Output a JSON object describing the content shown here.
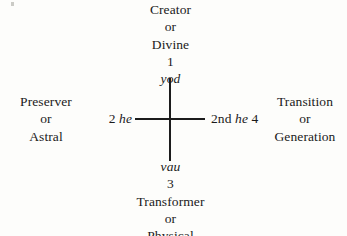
{
  "diagram": {
    "background_color": "#fdfdfb",
    "line_color": "#1c1c1c",
    "top": {
      "line1": "Creator",
      "line2": "or",
      "line3": "Divine",
      "number": "1",
      "hebrew_letter": "yod"
    },
    "bottom": {
      "hebrew_letter": "vau",
      "number": "3",
      "line1": "Transformer",
      "line2": "or",
      "line3": "Physical"
    },
    "left": {
      "line1": "Preserver",
      "line2": "or",
      "line3": "Astral",
      "axis_number": "2",
      "axis_hebrew_letter": "he"
    },
    "right": {
      "line1": "Transition",
      "line2": "or",
      "line3": "Generation",
      "axis_ordinal": "2nd",
      "axis_hebrew_letter": "he",
      "axis_number": "4"
    }
  }
}
